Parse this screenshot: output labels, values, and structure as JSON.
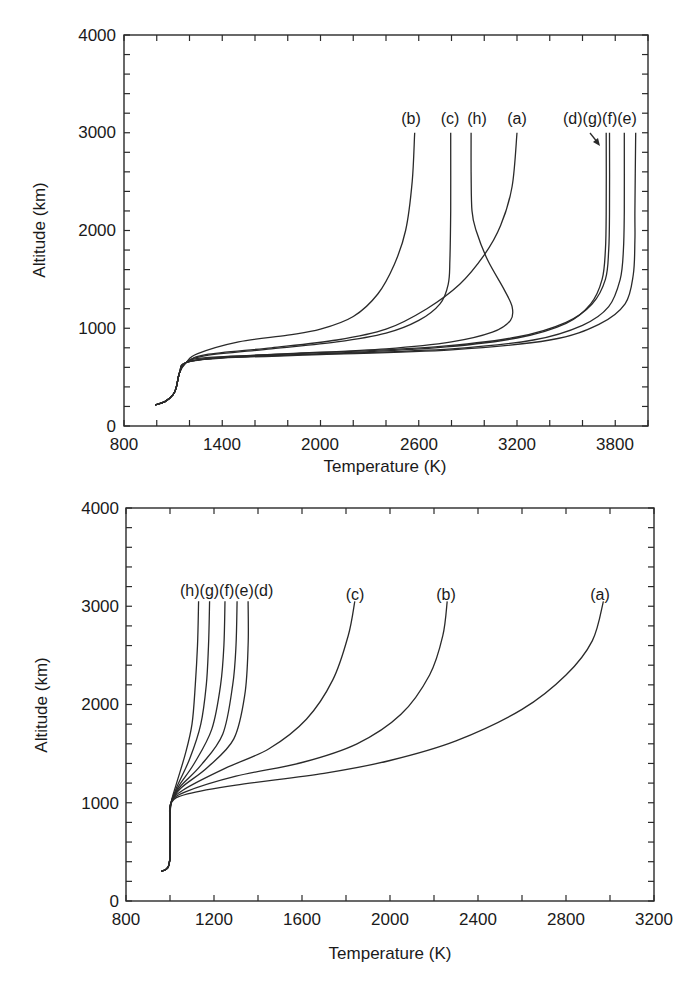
{
  "chart_data": [
    {
      "type": "line",
      "title": "",
      "xlabel": "Temperature  (K)",
      "ylabel": "Altitude (km)",
      "xlim": [
        800,
        4000
      ],
      "ylim": [
        0,
        4000
      ],
      "xticks_major": [
        800,
        1400,
        2000,
        2600,
        3200,
        3800
      ],
      "xtick_minor_step": 200,
      "yticks_major": [
        0,
        1000,
        2000,
        3000,
        4000
      ],
      "ytick_minor_step": 200,
      "grid": false,
      "legend": "inline labels at curve tops",
      "annotations": [
        "arrow pointing from (d)(g) labels to curve (d)"
      ],
      "series": [
        {
          "name": "(b)",
          "points": [
            [
              990,
              215
            ],
            [
              1050,
              250
            ],
            [
              1100,
              320
            ],
            [
              1120,
              400
            ],
            [
              1140,
              550
            ],
            [
              1180,
              650
            ],
            [
              1250,
              740
            ],
            [
              1500,
              860
            ],
            [
              1800,
              930
            ],
            [
              2000,
              990
            ],
            [
              2200,
              1120
            ],
            [
              2350,
              1350
            ],
            [
              2450,
              1650
            ],
            [
              2520,
              2000
            ],
            [
              2560,
              2500
            ],
            [
              2575,
              3000
            ]
          ]
        },
        {
          "name": "(c)",
          "points": [
            [
              990,
              215
            ],
            [
              1050,
              250
            ],
            [
              1100,
              320
            ],
            [
              1120,
              400
            ],
            [
              1140,
              550
            ],
            [
              1180,
              650
            ],
            [
              1300,
              720
            ],
            [
              1700,
              790
            ],
            [
              2100,
              860
            ],
            [
              2400,
              950
            ],
            [
              2600,
              1080
            ],
            [
              2730,
              1250
            ],
            [
              2780,
              1450
            ],
            [
              2790,
              1700
            ],
            [
              2795,
              2200
            ],
            [
              2795,
              3000
            ]
          ]
        },
        {
          "name": "(h)",
          "points": [
            [
              990,
              215
            ],
            [
              1050,
              250
            ],
            [
              1100,
              320
            ],
            [
              1120,
              400
            ],
            [
              1140,
              550
            ],
            [
              1180,
              650
            ],
            [
              1300,
              700
            ],
            [
              1800,
              740
            ],
            [
              2400,
              790
            ],
            [
              2800,
              860
            ],
            [
              3050,
              960
            ],
            [
              3160,
              1080
            ],
            [
              3170,
              1220
            ],
            [
              3120,
              1400
            ],
            [
              3020,
              1700
            ],
            [
              2950,
              2000
            ],
            [
              2925,
              2200
            ],
            [
              2920,
              2600
            ],
            [
              2920,
              3000
            ]
          ]
        },
        {
          "name": "(a)",
          "points": [
            [
              990,
              215
            ],
            [
              1050,
              250
            ],
            [
              1100,
              320
            ],
            [
              1120,
              400
            ],
            [
              1140,
              550
            ],
            [
              1180,
              650
            ],
            [
              1300,
              730
            ],
            [
              1700,
              800
            ],
            [
              2100,
              880
            ],
            [
              2400,
              990
            ],
            [
              2650,
              1200
            ],
            [
              2850,
              1450
            ],
            [
              3000,
              1750
            ],
            [
              3100,
              2050
            ],
            [
              3170,
              2450
            ],
            [
              3200,
              3000
            ]
          ]
        },
        {
          "name": "(d)",
          "points": [
            [
              990,
              215
            ],
            [
              1050,
              250
            ],
            [
              1100,
              320
            ],
            [
              1120,
              400
            ],
            [
              1140,
              550
            ],
            [
              1180,
              650
            ],
            [
              1400,
              700
            ],
            [
              2000,
              740
            ],
            [
              2700,
              800
            ],
            [
              3200,
              900
            ],
            [
              3500,
              1050
            ],
            [
              3650,
              1250
            ],
            [
              3720,
              1500
            ],
            [
              3740,
              1800
            ],
            [
              3745,
              2200
            ],
            [
              3745,
              3000
            ]
          ]
        },
        {
          "name": "(g)",
          "points": [
            [
              990,
              215
            ],
            [
              1050,
              250
            ],
            [
              1100,
              320
            ],
            [
              1120,
              400
            ],
            [
              1140,
              550
            ],
            [
              1180,
              650
            ],
            [
              1400,
              705
            ],
            [
              2000,
              750
            ],
            [
              2700,
              810
            ],
            [
              3200,
              910
            ],
            [
              3500,
              1060
            ],
            [
              3660,
              1250
            ],
            [
              3740,
              1500
            ],
            [
              3760,
              1800
            ],
            [
              3765,
              2200
            ],
            [
              3765,
              3000
            ]
          ]
        },
        {
          "name": "(f)",
          "points": [
            [
              990,
              215
            ],
            [
              1050,
              250
            ],
            [
              1100,
              320
            ],
            [
              1120,
              400
            ],
            [
              1140,
              550
            ],
            [
              1180,
              650
            ],
            [
              1400,
              700
            ],
            [
              2000,
              735
            ],
            [
              2800,
              790
            ],
            [
              3300,
              880
            ],
            [
              3600,
              1030
            ],
            [
              3760,
              1220
            ],
            [
              3830,
              1500
            ],
            [
              3850,
              1800
            ],
            [
              3855,
              2200
            ],
            [
              3855,
              3000
            ]
          ]
        },
        {
          "name": "(e)",
          "points": [
            [
              990,
              215
            ],
            [
              1050,
              250
            ],
            [
              1100,
              320
            ],
            [
              1120,
              400
            ],
            [
              1140,
              550
            ],
            [
              1180,
              650
            ],
            [
              1400,
              695
            ],
            [
              2000,
              730
            ],
            [
              2800,
              780
            ],
            [
              3400,
              880
            ],
            [
              3700,
              1040
            ],
            [
              3860,
              1250
            ],
            [
              3910,
              1550
            ],
            [
              3920,
              1900
            ],
            [
              3920,
              2200
            ],
            [
              3925,
              3000
            ]
          ]
        }
      ],
      "curve_labels": [
        "(b)",
        "(c)",
        "(h)",
        "(a)",
        "(d)(g)(f)(e)"
      ]
    },
    {
      "type": "line",
      "title": "",
      "xlabel": "Temperature  (K)",
      "ylabel": "Altitude (km)",
      "xlim": [
        800,
        3200
      ],
      "ylim": [
        0,
        4000
      ],
      "xticks_major": [
        800,
        1200,
        1600,
        2000,
        2400,
        2800,
        3200
      ],
      "xtick_minor_step": 200,
      "yticks_major": [
        0,
        1000,
        2000,
        3000,
        4000
      ],
      "ytick_minor_step": 200,
      "grid": false,
      "legend": "inline labels at curve tops",
      "series": [
        {
          "name": "(h)",
          "points": [
            [
              960,
              300
            ],
            [
              990,
              340
            ],
            [
              1000,
              450
            ],
            [
              1000,
              800
            ],
            [
              1005,
              1000
            ],
            [
              1030,
              1200
            ],
            [
              1070,
              1500
            ],
            [
              1100,
              1800
            ],
            [
              1115,
              2200
            ],
            [
              1125,
              2600
            ],
            [
              1130,
              3050
            ]
          ]
        },
        {
          "name": "(g)",
          "points": [
            [
              960,
              300
            ],
            [
              990,
              340
            ],
            [
              1000,
              450
            ],
            [
              1000,
              800
            ],
            [
              1005,
              1000
            ],
            [
              1035,
              1180
            ],
            [
              1090,
              1450
            ],
            [
              1140,
              1800
            ],
            [
              1165,
              2200
            ],
            [
              1175,
              2600
            ],
            [
              1180,
              3050
            ]
          ]
        },
        {
          "name": "(f)",
          "points": [
            [
              960,
              300
            ],
            [
              990,
              340
            ],
            [
              1000,
              450
            ],
            [
              1000,
              800
            ],
            [
              1005,
              1000
            ],
            [
              1040,
              1170
            ],
            [
              1110,
              1400
            ],
            [
              1190,
              1750
            ],
            [
              1230,
              2200
            ],
            [
              1245,
              2600
            ],
            [
              1250,
              3050
            ]
          ]
        },
        {
          "name": "(e)",
          "points": [
            [
              960,
              300
            ],
            [
              990,
              340
            ],
            [
              1000,
              450
            ],
            [
              1000,
              800
            ],
            [
              1005,
              1000
            ],
            [
              1045,
              1160
            ],
            [
              1140,
              1380
            ],
            [
              1240,
              1700
            ],
            [
              1285,
              2200
            ],
            [
              1300,
              2600
            ],
            [
              1305,
              3050
            ]
          ]
        },
        {
          "name": "(d)",
          "points": [
            [
              960,
              300
            ],
            [
              990,
              340
            ],
            [
              1000,
              450
            ],
            [
              1000,
              800
            ],
            [
              1005,
              1000
            ],
            [
              1050,
              1150
            ],
            [
              1170,
              1360
            ],
            [
              1290,
              1650
            ],
            [
              1340,
              2100
            ],
            [
              1355,
              2600
            ],
            [
              1355,
              3050
            ]
          ]
        },
        {
          "name": "(c)",
          "points": [
            [
              960,
              300
            ],
            [
              990,
              340
            ],
            [
              1000,
              450
            ],
            [
              1000,
              800
            ],
            [
              1005,
              1000
            ],
            [
              1060,
              1130
            ],
            [
              1250,
              1350
            ],
            [
              1450,
              1550
            ],
            [
              1620,
              1850
            ],
            [
              1740,
              2250
            ],
            [
              1810,
              2700
            ],
            [
              1840,
              3050
            ]
          ]
        },
        {
          "name": "(b)",
          "points": [
            [
              960,
              300
            ],
            [
              990,
              340
            ],
            [
              1000,
              450
            ],
            [
              1000,
              800
            ],
            [
              1005,
              1000
            ],
            [
              1070,
              1110
            ],
            [
              1300,
              1270
            ],
            [
              1600,
              1410
            ],
            [
              1850,
              1600
            ],
            [
              2050,
              1900
            ],
            [
              2180,
              2300
            ],
            [
              2240,
              2700
            ],
            [
              2260,
              3050
            ]
          ]
        },
        {
          "name": "(a)",
          "points": [
            [
              960,
              300
            ],
            [
              990,
              340
            ],
            [
              1000,
              450
            ],
            [
              1000,
              800
            ],
            [
              1005,
              1000
            ],
            [
              1080,
              1090
            ],
            [
              1300,
              1180
            ],
            [
              1700,
              1300
            ],
            [
              2000,
              1430
            ],
            [
              2300,
              1630
            ],
            [
              2600,
              1950
            ],
            [
              2800,
              2300
            ],
            [
              2920,
              2650
            ],
            [
              2970,
              3050
            ]
          ]
        }
      ],
      "curve_labels": [
        "(h)(g)(f)(e)(d)",
        "(c)",
        "(b)",
        "(a)"
      ]
    }
  ],
  "top_chart": {
    "ylabel": "Altitude (km)",
    "xlabel": "Temperature  (K)",
    "yticks": [
      "0",
      "1000",
      "2000",
      "3000",
      "4000"
    ],
    "xticks": [
      "800",
      "1400",
      "2000",
      "2600",
      "3200",
      "3800"
    ],
    "labels": {
      "b": "(b)",
      "c": "(c)",
      "h": "(h)",
      "a": "(a)",
      "dgfe": "(d)(g)(f)(e)"
    }
  },
  "bottom_chart": {
    "ylabel": "Altitude (km)",
    "xlabel": "Temperature  (K)",
    "yticks": [
      "0",
      "1000",
      "2000",
      "3000",
      "4000"
    ],
    "xticks": [
      "800",
      "1200",
      "1600",
      "2000",
      "2400",
      "2800",
      "3200"
    ],
    "labels": {
      "hgfed": "(h)(g)(f)(e)(d)",
      "c": "(c)",
      "b": "(b)",
      "a": "(a)"
    }
  }
}
